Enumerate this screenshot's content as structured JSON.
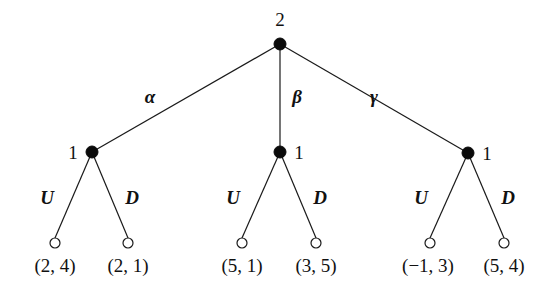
{
  "diagram": {
    "type": "extensive-form-game-tree",
    "root": {
      "player": "2",
      "x": 280,
      "y": 44,
      "label_pos": {
        "x": 280,
        "y": 26
      }
    },
    "branches": [
      {
        "action": "α",
        "action_pos": {
          "x": 150,
          "y": 103
        },
        "node": {
          "player": "1",
          "x": 92,
          "y": 152,
          "label_pos": {
            "x": 73,
            "y": 159
          },
          "label_anchor": "middle"
        },
        "children": [
          {
            "action": "U",
            "action_pos": {
              "x": 47,
              "y": 204
            },
            "x": 55,
            "y": 243,
            "payoff": "(2, 4)",
            "payoff_pos": {
              "x": 55,
              "y": 272
            }
          },
          {
            "action": "D",
            "action_pos": {
              "x": 132,
              "y": 204
            },
            "x": 128,
            "y": 243,
            "payoff": "(2, 1)",
            "payoff_pos": {
              "x": 128,
              "y": 272
            }
          }
        ]
      },
      {
        "action": "β",
        "action_pos": {
          "x": 297,
          "y": 103
        },
        "node": {
          "player": "1",
          "x": 280,
          "y": 152,
          "label_pos": {
            "x": 299,
            "y": 159
          },
          "label_anchor": "middle"
        },
        "children": [
          {
            "action": "U",
            "action_pos": {
              "x": 233,
              "y": 204
            },
            "x": 242,
            "y": 243,
            "payoff": "(5, 1)",
            "payoff_pos": {
              "x": 242,
              "y": 272
            }
          },
          {
            "action": "D",
            "action_pos": {
              "x": 320,
              "y": 204
            },
            "x": 316,
            "y": 243,
            "payoff": "(3, 5)",
            "payoff_pos": {
              "x": 316,
              "y": 272
            }
          }
        ]
      },
      {
        "action": "γ",
        "action_pos": {
          "x": 374,
          "y": 103
        },
        "node": {
          "player": "1",
          "x": 468,
          "y": 153,
          "label_pos": {
            "x": 487,
            "y": 160
          },
          "label_anchor": "middle"
        },
        "children": [
          {
            "action": "U",
            "action_pos": {
              "x": 421,
              "y": 204
            },
            "x": 430,
            "y": 243,
            "payoff": "(−1, 3)",
            "payoff_pos": {
              "x": 428,
              "y": 272
            }
          },
          {
            "action": "D",
            "action_pos": {
              "x": 508,
              "y": 204
            },
            "x": 504,
            "y": 243,
            "payoff": "(5, 4)",
            "payoff_pos": {
              "x": 504,
              "y": 272
            }
          }
        ]
      }
    ],
    "style": {
      "line_color": "#1a1a1a",
      "decision_node_color": "#0a0a0a",
      "terminal_node_fill": "#ffffff",
      "decision_radius": 6,
      "terminal_radius": 5
    }
  }
}
